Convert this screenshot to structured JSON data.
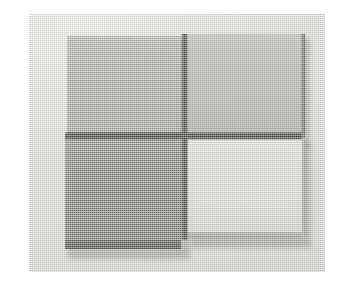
{
  "scene": {
    "kind": "photograph",
    "subject": "four square ceramic tile samples arranged in a 2x2 grid",
    "caption": "",
    "surface_color": "#d9d9d6",
    "page_background": "#ffffff",
    "photo_frame": {
      "left": 29,
      "top": 14,
      "width": 296,
      "height": 258
    }
  },
  "arrangement": {
    "rows": 2,
    "columns": 2,
    "gap_color": "#201f1e",
    "center_x": 153,
    "center_y": 121
  },
  "tiles": [
    {
      "id": "tile-top-left",
      "position": "top-left",
      "shade_label": "medium gray",
      "top_color": "#9b9b98",
      "side_color": "#6a6a67",
      "edge_color": "#2a2a28",
      "x": 38,
      "y": 22,
      "width": 114,
      "height": 96,
      "thickness": 5
    },
    {
      "id": "tile-top-right",
      "position": "top-right",
      "shade_label": "medium gray",
      "top_color": "#a2a29f",
      "side_color": "#767672",
      "edge_color": "#33332f",
      "x": 159,
      "y": 20,
      "width": 113,
      "height": 99,
      "thickness": 5
    },
    {
      "id": "tile-bottom-left",
      "position": "bottom-left",
      "shade_label": "dark gray",
      "top_color": "#5e5e5c",
      "side_color": "#3a3a38",
      "edge_color": "#1e1e1c",
      "x": 36,
      "y": 126,
      "width": 116,
      "height": 100,
      "thickness": 9
    },
    {
      "id": "tile-bottom-right",
      "position": "bottom-right",
      "shade_label": "off white",
      "top_color": "#e4e4e0",
      "side_color": "#9d9d99",
      "edge_color": "#7d7d79",
      "x": 159,
      "y": 125,
      "width": 114,
      "height": 93,
      "thickness": 6
    }
  ],
  "seams": {
    "vertical": {
      "x": 152,
      "y": 20,
      "width": 7,
      "height": 206,
      "color": "#1c1b1a"
    },
    "horizontal": {
      "x": 36,
      "y": 118,
      "width": 237,
      "height": 8,
      "color": "#141413"
    }
  }
}
